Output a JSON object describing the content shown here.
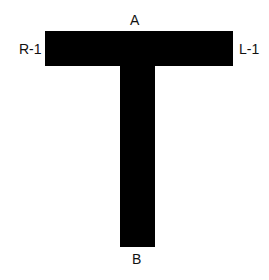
{
  "diagram": {
    "shape": "T-shape",
    "fill_color": "#000000",
    "background_color": "#ffffff",
    "labels": {
      "top": "A",
      "bottom": "B",
      "left": "R-1",
      "right": "L-1"
    }
  }
}
